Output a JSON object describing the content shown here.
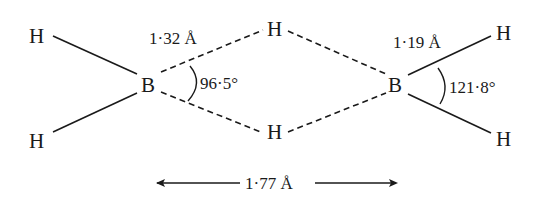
{
  "atoms": {
    "h_terminal_left_top": "H",
    "h_terminal_left_bottom": "H",
    "boron_left": "B",
    "h_bridge_top": "H",
    "h_bridge_bottom": "H",
    "boron_right": "B",
    "h_terminal_right_top": "H",
    "h_terminal_right_bottom": "H"
  },
  "labels": {
    "bridge_bond_length": "1·32 Å",
    "bridge_angle": "96·5°",
    "terminal_bond_length": "1·19 Å",
    "terminal_angle": "121·8°",
    "b_b_distance": "1·77 Å"
  },
  "colors": {
    "ink": "#1a1a1a",
    "background": "#ffffff"
  }
}
